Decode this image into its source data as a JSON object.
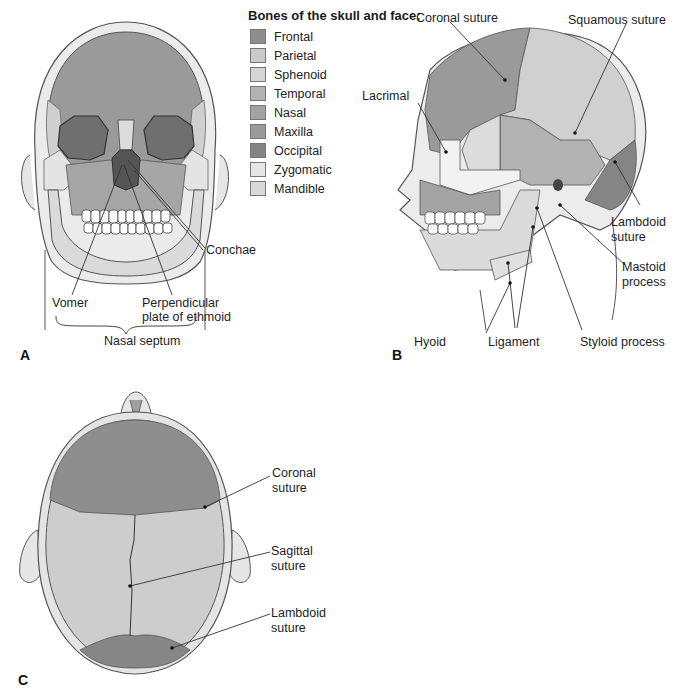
{
  "legend": {
    "title": "Bones of the skull and face:",
    "items": [
      {
        "label": "Frontal",
        "color": "#8e8e8e"
      },
      {
        "label": "Parietal",
        "color": "#c9c9c9"
      },
      {
        "label": "Sphenoid",
        "color": "#d6d6d6"
      },
      {
        "label": "Temporal",
        "color": "#b2b2b2"
      },
      {
        "label": "Nasal",
        "color": "#a3a3a3"
      },
      {
        "label": "Maxilla",
        "color": "#9a9a9a"
      },
      {
        "label": "Occipital",
        "color": "#838383"
      },
      {
        "label": "Zygomatic",
        "color": "#e6e6e6"
      },
      {
        "label": "Mandible",
        "color": "#d9d9d9"
      }
    ]
  },
  "panels": {
    "a": {
      "letter": "A",
      "labels": {
        "conchae": "Conchae",
        "vomer": "Vomer",
        "perpendicular_1": "Perpendicular",
        "perpendicular_2": "plate of ethmoid",
        "nasal_septum": "Nasal septum"
      }
    },
    "b": {
      "letter": "B",
      "labels": {
        "coronal_suture": "Coronal suture",
        "squamous_suture": "Squamous suture",
        "lacrimal": "Lacrimal",
        "lambdoid_1": "Lambdoid",
        "lambdoid_2": "suture",
        "mastoid_1": "Mastoid",
        "mastoid_2": "process",
        "hyoid": "Hyoid",
        "ligament": "Ligament",
        "styloid_process": "Styloid process"
      }
    },
    "c": {
      "letter": "C",
      "labels": {
        "coronal_1": "Coronal",
        "coronal_2": "suture",
        "sagittal_1": "Sagittal",
        "sagittal_2": "suture",
        "lambdoid_1": "Lambdoid",
        "lambdoid_2": "suture"
      }
    }
  }
}
